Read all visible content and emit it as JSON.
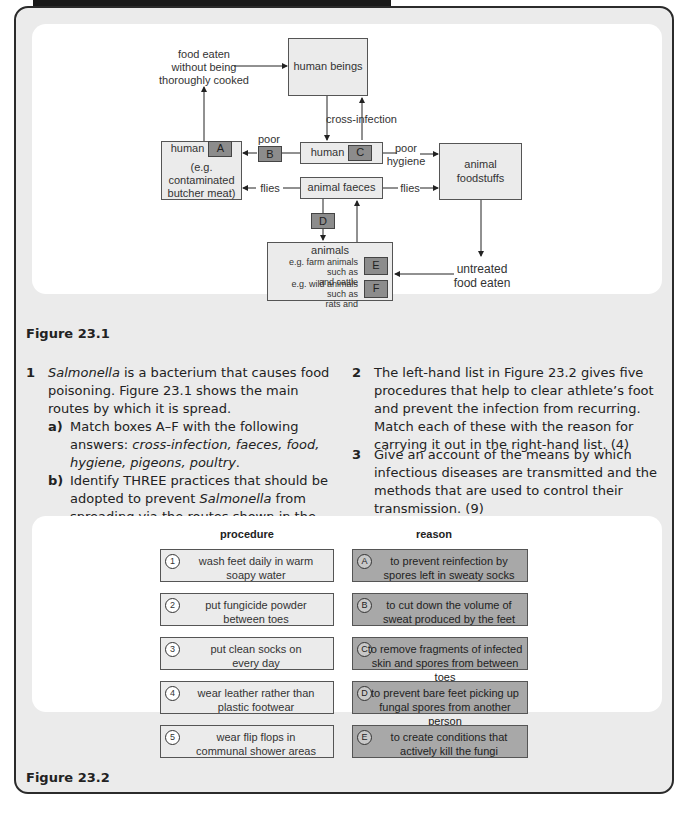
{
  "figure1": {
    "caption": "Figure 23.1",
    "nodes": {
      "human_beings": "human beings",
      "food_eaten_line1": "food eaten",
      "food_eaten_line2": "without being",
      "food_eaten_line3": "thoroughly cooked",
      "cross_infection": "cross-infection",
      "poor": "poor",
      "human_a_label": "human",
      "human_a_example1": "(e.g. contaminated",
      "human_a_example2": "butcher meat)",
      "human_c_label": "human",
      "poor_hygiene1": "poor",
      "poor_hygiene2": "hygiene",
      "animal_foodstuffs1": "animal",
      "animal_foodstuffs2": "foodstuffs",
      "flies_left": "flies",
      "flies_right": "flies",
      "animal_faeces": "animal faeces",
      "animals": "animals",
      "farm_line1": "e.g. farm animals such as",
      "farm_line2": "and cattle",
      "wild_line1": "e.g. wild animals such as",
      "wild_line2": "rats and",
      "untreated1": "untreated",
      "untreated2": "food eaten"
    },
    "letters": {
      "A": "A",
      "B": "B",
      "C": "C",
      "D": "D",
      "E": "E",
      "F": "F"
    }
  },
  "questions": {
    "q1": {
      "num": "1",
      "text_italic": "Salmonella",
      "text": " is a bacterium that causes food poisoning. Figure 23.1 shows the main routes by which it is spread.",
      "a_label": "a)",
      "a_text": "Match boxes A–F with the following answers: ",
      "a_answers": "cross-infection, faeces, food, hygiene, pigeons, poultry",
      "a_end": ".",
      "b_label": "b)",
      "b_text1": "Identify THREE practices that should be adopted to prevent ",
      "b_italic": "Salmonella",
      "b_text2": " from spreading via the routes shown in the diagram. (3)"
    },
    "q2": {
      "num": "2",
      "text": "The left-hand list in Figure 23.2 gives five procedures that help to clear athlete’s foot and prevent the infection from recurring. Match each of these with the reason for carrying it out in the right-hand list. (4)"
    },
    "q3": {
      "num": "3",
      "text": "Give an account of the means by which infectious diseases are transmitted and the methods that are used to control their transmission. (9)"
    }
  },
  "figure2": {
    "caption": "Figure 23.2",
    "procedure_header": "procedure",
    "reason_header": "reason",
    "procedures": [
      {
        "mark": "1",
        "line1": "wash feet daily in warm",
        "line2": "soapy water"
      },
      {
        "mark": "2",
        "line1": "put fungicide powder",
        "line2": "between toes"
      },
      {
        "mark": "3",
        "line1": "put clean socks on",
        "line2": "every day"
      },
      {
        "mark": "4",
        "line1": "wear leather rather than",
        "line2": "plastic footwear"
      },
      {
        "mark": "5",
        "line1": "wear flip flops in",
        "line2": "communal shower areas"
      }
    ],
    "reasons": [
      {
        "mark": "A",
        "line1": "to prevent reinfection by",
        "line2": "spores left in sweaty socks"
      },
      {
        "mark": "B",
        "line1": "to cut down the volume of",
        "line2": "sweat produced by the feet"
      },
      {
        "mark": "C",
        "line1": "to remove fragments of infected",
        "line2": "skin and spores from between toes"
      },
      {
        "mark": "D",
        "line1": "to prevent bare feet picking up",
        "line2": "fungal spores from another person"
      },
      {
        "mark": "E",
        "line1": "to create conditions that",
        "line2": "actively kill the fungi"
      }
    ]
  }
}
